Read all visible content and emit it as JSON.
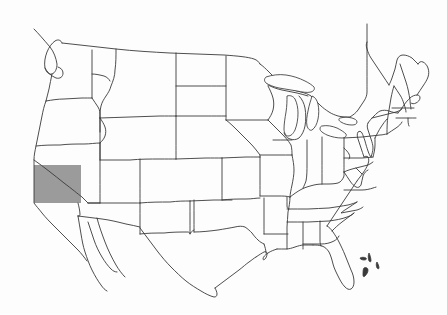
{
  "figure": {
    "type": "choropleth-outline-map",
    "region": "Contiguous United States",
    "title": "",
    "caption": "",
    "background_color": "#fdfdfd",
    "border_color": "#3a3a3a",
    "highlight_color": "#9b9b9b",
    "highlight_label": "Nevada",
    "highlighted_regions": [
      "Nevada"
    ],
    "legend": [],
    "labels_visible": false
  },
  "map_data": {
    "projection": "equirectangular-approx",
    "width": 447,
    "height": 315,
    "features": {
      "national_outline": "contiguous-us-coastline",
      "state_borders": "48-state internal boundaries",
      "great_lakes": [
        "Lake Superior",
        "Lake Michigan",
        "Lake Huron",
        "Lake Erie",
        "Lake Ontario"
      ],
      "extra_landmasses": [
        "Baja California",
        "Northern Mexico",
        "Bahamas islets"
      ]
    },
    "highlight": {
      "name": "Nevada",
      "fill": "#9b9b9b",
      "x": 34,
      "y": 165,
      "width": 47,
      "height": 38
    },
    "states": [
      "Washington",
      "Oregon",
      "California",
      "Nevada",
      "Idaho",
      "Montana",
      "Wyoming",
      "Utah",
      "Arizona",
      "Colorado",
      "New Mexico",
      "North Dakota",
      "South Dakota",
      "Nebraska",
      "Kansas",
      "Oklahoma",
      "Texas",
      "Minnesota",
      "Iowa",
      "Missouri",
      "Arkansas",
      "Louisiana",
      "Wisconsin",
      "Illinois",
      "Michigan",
      "Indiana",
      "Ohio",
      "Kentucky",
      "Tennessee",
      "Mississippi",
      "Alabama",
      "Georgia",
      "Florida",
      "South Carolina",
      "North Carolina",
      "Virginia",
      "West Virginia",
      "Maryland",
      "Delaware",
      "Pennsylvania",
      "New Jersey",
      "New York",
      "Connecticut",
      "Rhode Island",
      "Massachusetts",
      "Vermont",
      "New Hampshire",
      "Maine"
    ]
  }
}
